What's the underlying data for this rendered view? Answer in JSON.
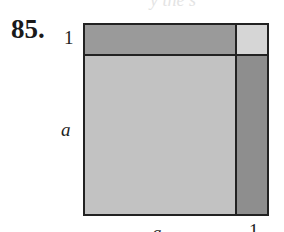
{
  "header": {
    "fragment": "y the s"
  },
  "problem": {
    "number": "85."
  },
  "figure": {
    "labels": {
      "left_top": "1",
      "left_main": "a",
      "bottom_main": "a",
      "bottom_right": "1"
    },
    "regions": [
      {
        "name": "a-by-1 strip (top)",
        "color": "#9a9a9a"
      },
      {
        "name": "1-by-1 corner",
        "color": "#d6d6d6"
      },
      {
        "name": "a-by-a square",
        "color": "#c2c2c2"
      },
      {
        "name": "1-by-a strip (right)",
        "color": "#8e8e8e"
      }
    ]
  }
}
